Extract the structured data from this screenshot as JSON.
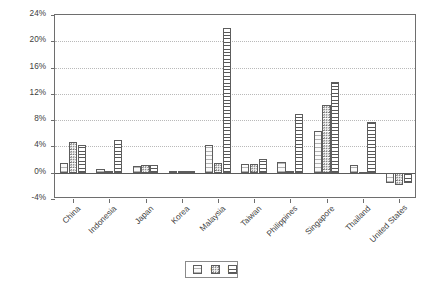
{
  "chart_data": {
    "type": "bar",
    "title": "",
    "subtitle": "",
    "xlabel": "",
    "ylabel": "",
    "ylim": [
      -4,
      24
    ],
    "ytick_labels": [
      "24%",
      "20%",
      "16%",
      "12%",
      "8%",
      "4%",
      "0%",
      "-4%"
    ],
    "ytick_values": [
      24,
      20,
      16,
      12,
      8,
      4,
      0,
      -4
    ],
    "grid": true,
    "grid_axis": "y",
    "legend_position": "bottom-center",
    "value_suffix": "%",
    "categories": [
      "China",
      "Indonesia",
      "Japan",
      "Korea",
      "Malaysia",
      "Taiwan",
      "Philippines",
      "Singapore",
      "Thailand",
      "United States"
    ],
    "series": [
      {
        "name": "G",
        "pattern": "horizontal-fine-lines",
        "values": [
          1.5,
          0.5,
          1.0,
          0.2,
          4.2,
          1.4,
          1.7,
          6.3,
          1.2,
          -1.5
        ]
      },
      {
        "name": "C",
        "pattern": "dotted",
        "values": [
          4.7,
          0.3,
          1.1,
          0.2,
          1.5,
          1.3,
          0.3,
          10.3,
          0.1,
          -1.8
        ]
      },
      {
        "name": "I",
        "pattern": "horizontal-lines",
        "values": [
          4.2,
          5.0,
          1.2,
          0.3,
          22.0,
          2.1,
          9.0,
          13.8,
          7.7,
          -1.5
        ]
      }
    ]
  },
  "legend": {
    "entries": [
      {
        "label": "G",
        "swatch": "series-G-swatch"
      },
      {
        "label": "C",
        "swatch": "series-C-swatch"
      },
      {
        "label": "I",
        "swatch": "series-I-swatch"
      }
    ]
  }
}
